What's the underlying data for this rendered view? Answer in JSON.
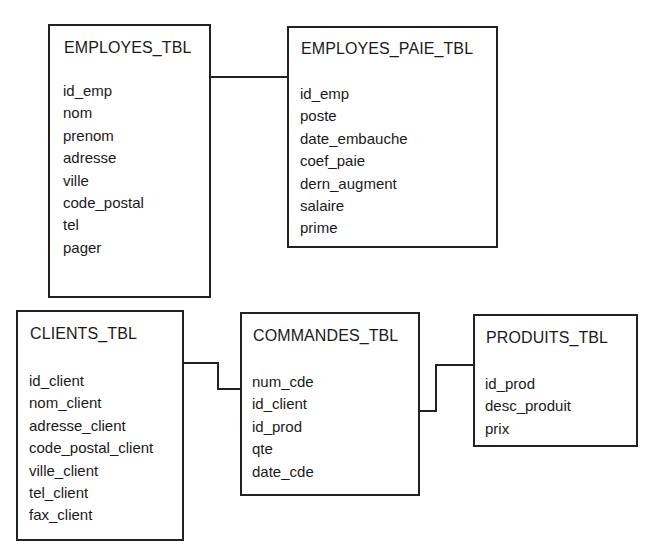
{
  "tables": {
    "employes": {
      "title": "EMPLOYES_TBL",
      "fields": [
        "id_emp",
        "nom",
        "prenom",
        "adresse",
        "ville",
        "code_postal",
        "tel",
        "pager"
      ]
    },
    "employes_paie": {
      "title": "EMPLOYES_PAIE_TBL",
      "fields": [
        "id_emp",
        "poste",
        "date_embauche",
        "coef_paie",
        "dern_augment",
        "salaire",
        "prime"
      ]
    },
    "clients": {
      "title": "CLIENTS_TBL",
      "fields": [
        "id_client",
        "nom_client",
        "adresse_client",
        "code_postal_client",
        "ville_client",
        "tel_client",
        "fax_client"
      ]
    },
    "commandes": {
      "title": "COMMANDES_TBL",
      "fields": [
        "num_cde",
        "id_client",
        "id_prod",
        "qte",
        "date_cde"
      ]
    },
    "produits": {
      "title": "PRODUITS_TBL",
      "fields": [
        "id_prod",
        "desc_produit",
        "prix"
      ]
    }
  },
  "relationships": [
    {
      "from": "EMPLOYES_TBL",
      "to": "EMPLOYES_PAIE_TBL"
    },
    {
      "from": "CLIENTS_TBL",
      "to": "COMMANDES_TBL"
    },
    {
      "from": "COMMANDES_TBL",
      "to": "PRODUITS_TBL"
    }
  ]
}
